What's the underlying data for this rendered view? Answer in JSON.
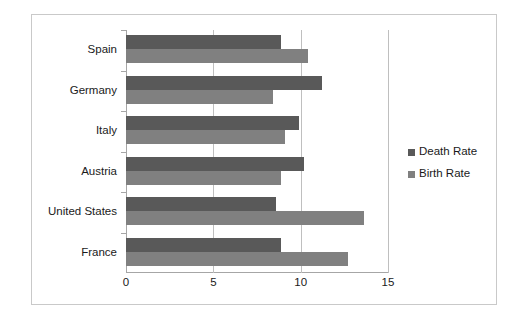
{
  "chart_data": {
    "type": "bar",
    "orientation": "horizontal",
    "title": "",
    "xlabel": "",
    "ylabel": "",
    "xlim": [
      0,
      15
    ],
    "xticks": [
      "0",
      "5",
      "10",
      "15"
    ],
    "xtick_values": [
      0,
      5,
      10,
      15
    ],
    "grid": "vertical",
    "legend_position": "right",
    "categories": [
      "France",
      "United States",
      "Austria",
      "Italy",
      "Germany",
      "Spain"
    ],
    "series": [
      {
        "name": "Death Rate",
        "color": "#595959",
        "values": [
          8.9,
          8.6,
          10.2,
          9.9,
          11.2,
          8.9
        ]
      },
      {
        "name": "Birth Rate",
        "color": "#808080",
        "values": [
          12.7,
          13.6,
          8.9,
          9.1,
          8.4,
          10.4
        ]
      }
    ]
  },
  "legend": {
    "items": [
      {
        "label": "Death Rate",
        "color": "#595959"
      },
      {
        "label": "Birth Rate",
        "color": "#808080"
      }
    ]
  },
  "colors": {
    "death_rate": "#595959",
    "birth_rate": "#808080",
    "gridline": "#bfbfbf",
    "axis": "#a6a6a6",
    "frame": "#c9c9c9",
    "text": "#1a1a1a",
    "background": "#ffffff"
  }
}
